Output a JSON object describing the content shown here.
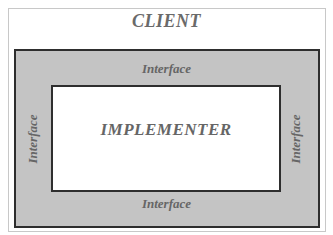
{
  "diagram": {
    "client_label": "CLIENT",
    "implementer_label": "IMPLEMENTER",
    "interface_labels": {
      "top": "Interface",
      "bottom": "Interface",
      "left": "Interface",
      "right": "Interface"
    },
    "colors": {
      "interface_fill": "#c4c4c4",
      "border": "#2e2e2e",
      "text": "#666666"
    }
  }
}
